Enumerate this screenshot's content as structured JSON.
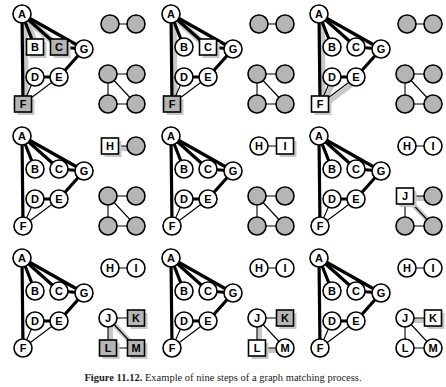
{
  "figure": {
    "caption_prefix": "Figure 11.12.",
    "caption_text": "Example of nine steps of a graph matching process.",
    "caption_full": "Figure 11.12.  Example of nine steps of a graph matching process.",
    "panel_count": 9,
    "rows": 3,
    "columns": 3
  },
  "colors": {
    "node_stroke": "#000000",
    "node_fill_white": "#ffffff",
    "node_fill_gray": "#b5b5b5",
    "box_fill_gray": "#b9b9b9",
    "box_fill_white": "#ffffff",
    "edge_normal": "#000000",
    "edge_bold": "#000000",
    "shadow": "#c8c8c8",
    "background": "#ffffff",
    "label_text": "#000000"
  },
  "main_graph": {
    "name": "model-graph-ABCDEFG",
    "nodes": [
      {
        "id": "A",
        "label": "A",
        "x": 22,
        "y": 14
      },
      {
        "id": "B",
        "label": "B",
        "x": 35,
        "y": 47
      },
      {
        "id": "C",
        "label": "C",
        "x": 59,
        "y": 47
      },
      {
        "id": "D",
        "label": "D",
        "x": 35,
        "y": 77
      },
      {
        "id": "E",
        "label": "E",
        "x": 59,
        "y": 77
      },
      {
        "id": "F",
        "label": "F",
        "x": 23,
        "y": 104
      },
      {
        "id": "G",
        "label": "G",
        "x": 84,
        "y": 49
      }
    ],
    "edges": [
      {
        "from": "A",
        "to": "B",
        "weight": "bold"
      },
      {
        "from": "A",
        "to": "C",
        "weight": "bold"
      },
      {
        "from": "A",
        "to": "G",
        "weight": "bold"
      },
      {
        "from": "A",
        "to": "F",
        "weight": "bold"
      },
      {
        "from": "C",
        "to": "G",
        "weight": "bold"
      },
      {
        "from": "G",
        "to": "E",
        "weight": "bold"
      },
      {
        "from": "D",
        "to": "E",
        "weight": "bold"
      },
      {
        "from": "D",
        "to": "F",
        "weight": "thin"
      },
      {
        "from": "E",
        "to": "F",
        "weight": "thin"
      }
    ]
  },
  "aux_pair_graph": {
    "name": "aux-graph-HI",
    "nodes": [
      {
        "id": "H",
        "label": "H",
        "x": 110,
        "y": 24
      },
      {
        "id": "I",
        "label": "I",
        "x": 136,
        "y": 24
      }
    ],
    "edges": [
      {
        "from": "H",
        "to": "I",
        "weight": "thin"
      }
    ]
  },
  "aux_quad_graph": {
    "name": "aux-graph-JKLM",
    "nodes": [
      {
        "id": "J",
        "label": "J",
        "x": 108,
        "y": 74
      },
      {
        "id": "K",
        "label": "K",
        "x": 136,
        "y": 74
      },
      {
        "id": "L",
        "label": "L",
        "x": 108,
        "y": 104
      },
      {
        "id": "M",
        "label": "M",
        "x": 136,
        "y": 104
      }
    ],
    "edges": [
      {
        "from": "J",
        "to": "K",
        "weight": "thin"
      },
      {
        "from": "J",
        "to": "L",
        "weight": "thin"
      },
      {
        "from": "J",
        "to": "M",
        "weight": "thin"
      },
      {
        "from": "L",
        "to": "M",
        "weight": "thin"
      }
    ]
  },
  "panels": [
    {
      "index": 1,
      "name": "panel-step-1",
      "step_label": "1",
      "main_shapes": {
        "A": "circle",
        "B": "box",
        "C": "box",
        "D": "circle",
        "E": "circle",
        "F": "box",
        "G": "circle"
      },
      "main_box_fill": {
        "B": "white",
        "C": "gray",
        "F": "gray"
      },
      "main_labels_visible": true,
      "aux_pair_labels_visible": false,
      "aux_pair_shapes": {
        "H": "circle",
        "I": "circle"
      },
      "aux_pair_fill": {
        "H": "gray",
        "I": "gray"
      },
      "aux_quad_labels_visible": false,
      "aux_quad_shapes": {
        "J": "circle",
        "K": "circle",
        "L": "circle",
        "M": "circle"
      },
      "aux_quad_fill": {
        "J": "gray",
        "K": "gray",
        "L": "gray",
        "M": "gray"
      },
      "shadow_nodes": [
        "B",
        "C",
        "F"
      ],
      "shadow_edges": [
        [
          "A",
          "B"
        ],
        [
          "A",
          "C"
        ],
        [
          "A",
          "F"
        ]
      ]
    },
    {
      "index": 2,
      "name": "panel-step-2",
      "step_label": "2",
      "main_shapes": {
        "A": "circle",
        "B": "circle",
        "C": "box",
        "D": "circle",
        "E": "circle",
        "F": "box",
        "G": "circle"
      },
      "main_box_fill": {
        "C": "white",
        "F": "gray"
      },
      "main_labels_visible": true,
      "aux_pair_labels_visible": false,
      "aux_pair_shapes": {
        "H": "circle",
        "I": "circle"
      },
      "aux_pair_fill": {
        "H": "gray",
        "I": "gray"
      },
      "aux_quad_labels_visible": false,
      "aux_quad_shapes": {
        "J": "circle",
        "K": "circle",
        "L": "circle",
        "M": "circle"
      },
      "aux_quad_fill": {
        "J": "gray",
        "K": "gray",
        "L": "gray",
        "M": "gray"
      },
      "shadow_nodes": [
        "C",
        "F"
      ],
      "shadow_edges": [
        [
          "A",
          "C"
        ],
        [
          "A",
          "F"
        ]
      ]
    },
    {
      "index": 3,
      "name": "panel-step-3",
      "step_label": "3",
      "main_shapes": {
        "A": "circle",
        "B": "circle",
        "C": "circle",
        "D": "circle",
        "E": "circle",
        "F": "box",
        "G": "circle"
      },
      "main_box_fill": {
        "F": "white"
      },
      "main_labels_visible": true,
      "aux_pair_labels_visible": false,
      "aux_pair_shapes": {
        "H": "circle",
        "I": "circle"
      },
      "aux_pair_fill": {
        "H": "gray",
        "I": "gray"
      },
      "aux_quad_labels_visible": false,
      "aux_quad_shapes": {
        "J": "circle",
        "K": "circle",
        "L": "circle",
        "M": "circle"
      },
      "aux_quad_fill": {
        "J": "gray",
        "K": "gray",
        "L": "gray",
        "M": "gray"
      },
      "shadow_nodes": [
        "F"
      ],
      "shadow_edges": [
        [
          "A",
          "F"
        ],
        [
          "D",
          "F"
        ],
        [
          "E",
          "F"
        ]
      ]
    },
    {
      "index": 4,
      "name": "panel-step-4",
      "step_label": "4",
      "main_shapes": {
        "A": "circle",
        "B": "circle",
        "C": "circle",
        "D": "circle",
        "E": "circle",
        "F": "circle",
        "G": "circle"
      },
      "main_box_fill": {},
      "main_labels_visible": true,
      "aux_pair_labels_visible": "H",
      "aux_pair_shapes": {
        "H": "box",
        "I": "circle"
      },
      "aux_pair_fill": {
        "H": "white",
        "I": "gray"
      },
      "aux_quad_labels_visible": false,
      "aux_quad_shapes": {
        "J": "circle",
        "K": "circle",
        "L": "circle",
        "M": "circle"
      },
      "aux_quad_fill": {
        "J": "gray",
        "K": "gray",
        "L": "gray",
        "M": "gray"
      },
      "shadow_nodes": [
        "H"
      ],
      "shadow_edges": [
        [
          "H",
          "I"
        ]
      ]
    },
    {
      "index": 5,
      "name": "panel-step-5",
      "step_label": "5",
      "main_shapes": {
        "A": "circle",
        "B": "circle",
        "C": "circle",
        "D": "circle",
        "E": "circle",
        "F": "circle",
        "G": "circle"
      },
      "main_box_fill": {},
      "main_labels_visible": true,
      "aux_pair_labels_visible": "HI",
      "aux_pair_shapes": {
        "H": "circle",
        "I": "box"
      },
      "aux_pair_fill": {
        "H": "white",
        "I": "white"
      },
      "aux_quad_labels_visible": false,
      "aux_quad_shapes": {
        "J": "circle",
        "K": "circle",
        "L": "circle",
        "M": "circle"
      },
      "aux_quad_fill": {
        "J": "gray",
        "K": "gray",
        "L": "gray",
        "M": "gray"
      },
      "shadow_nodes": [
        "I"
      ],
      "shadow_edges": []
    },
    {
      "index": 6,
      "name": "panel-step-6",
      "step_label": "6",
      "main_shapes": {
        "A": "circle",
        "B": "circle",
        "C": "circle",
        "D": "circle",
        "E": "circle",
        "F": "circle",
        "G": "circle"
      },
      "main_box_fill": {},
      "main_labels_visible": true,
      "aux_pair_labels_visible": "HI",
      "aux_pair_shapes": {
        "H": "circle",
        "I": "circle"
      },
      "aux_pair_fill": {
        "H": "white",
        "I": "white"
      },
      "aux_quad_labels_visible": "J",
      "aux_quad_shapes": {
        "J": "box",
        "K": "circle",
        "L": "circle",
        "M": "circle"
      },
      "aux_quad_fill": {
        "J": "white",
        "K": "gray",
        "L": "gray",
        "M": "gray"
      },
      "shadow_nodes": [
        "J"
      ],
      "shadow_edges": [
        [
          "J",
          "K"
        ],
        [
          "J",
          "M"
        ]
      ]
    },
    {
      "index": 7,
      "name": "panel-step-7",
      "step_label": "7",
      "main_shapes": {
        "A": "circle",
        "B": "circle",
        "C": "circle",
        "D": "circle",
        "E": "circle",
        "F": "circle",
        "G": "circle"
      },
      "main_box_fill": {},
      "main_labels_visible": true,
      "aux_pair_labels_visible": "HI",
      "aux_pair_shapes": {
        "H": "circle",
        "I": "circle"
      },
      "aux_pair_fill": {
        "H": "white",
        "I": "white"
      },
      "aux_quad_labels_visible": "JKLM",
      "aux_quad_shapes": {
        "J": "circle",
        "K": "box",
        "L": "box",
        "M": "box"
      },
      "aux_quad_fill": {
        "J": "white",
        "K": "gray",
        "L": "gray",
        "M": "gray"
      },
      "shadow_nodes": [
        "K",
        "L",
        "M"
      ],
      "shadow_edges": [
        [
          "J",
          "L"
        ],
        [
          "J",
          "M"
        ]
      ]
    },
    {
      "index": 8,
      "name": "panel-step-8",
      "step_label": "8",
      "main_shapes": {
        "A": "circle",
        "B": "circle",
        "C": "circle",
        "D": "circle",
        "E": "circle",
        "F": "circle",
        "G": "circle"
      },
      "main_box_fill": {},
      "main_labels_visible": true,
      "aux_pair_labels_visible": "HI",
      "aux_pair_shapes": {
        "H": "circle",
        "I": "circle"
      },
      "aux_pair_fill": {
        "H": "white",
        "I": "white"
      },
      "aux_quad_labels_visible": "JKLM",
      "aux_quad_shapes": {
        "J": "circle",
        "K": "box",
        "L": "box",
        "M": "circle"
      },
      "aux_quad_fill": {
        "J": "white",
        "K": "gray",
        "L": "white",
        "M": "white"
      },
      "shadow_nodes": [
        "K",
        "L"
      ],
      "shadow_edges": [
        [
          "J",
          "L"
        ],
        [
          "L",
          "M"
        ]
      ]
    },
    {
      "index": 9,
      "name": "panel-step-9",
      "step_label": "9",
      "main_shapes": {
        "A": "circle",
        "B": "circle",
        "C": "circle",
        "D": "circle",
        "E": "circle",
        "F": "circle",
        "G": "circle"
      },
      "main_box_fill": {},
      "main_labels_visible": true,
      "aux_pair_labels_visible": "HI",
      "aux_pair_shapes": {
        "H": "circle",
        "I": "circle"
      },
      "aux_pair_fill": {
        "H": "white",
        "I": "white"
      },
      "aux_quad_labels_visible": "JKLM",
      "aux_quad_shapes": {
        "J": "circle",
        "K": "box",
        "L": "circle",
        "M": "circle"
      },
      "aux_quad_fill": {
        "J": "white",
        "K": "white",
        "L": "white",
        "M": "white"
      },
      "shadow_nodes": [
        "K"
      ],
      "shadow_edges": [
        [
          "J",
          "K"
        ]
      ]
    }
  ]
}
